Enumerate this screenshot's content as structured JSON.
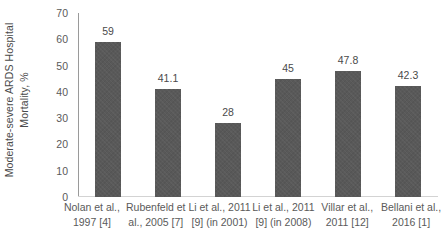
{
  "chart_data": {
    "type": "bar",
    "title": "",
    "xlabel": "",
    "ylabel": "Moderate-severe ARDS Hospital Mortality, %",
    "ylabel_lines": [
      "Moderate-severe ARDS Hospital",
      "Mortality, %"
    ],
    "ylim": [
      0,
      70
    ],
    "ytick_labels": [
      "70",
      "60",
      "50",
      "40",
      "30",
      "20",
      "10",
      "0"
    ],
    "ytick_values": [
      70,
      60,
      50,
      40,
      30,
      20,
      10,
      0
    ],
    "grid": false,
    "legend": false,
    "bar_color": "#595959",
    "categories": [
      "Nolan et al., 1997 [4]",
      "Rubenfeld et al., 2005 [7]",
      "Li et al., 2011 [9] (in 2001)",
      "Li et al., 2011 [9] (in 2008)",
      "Villar et al., 2011 [12]",
      "Bellani et al., 2016 [1]"
    ],
    "category_lines": [
      [
        "Nolan et al.,",
        "1997 [4]"
      ],
      [
        "Rubenfeld et",
        "al., 2005 [7]"
      ],
      [
        "Li et al., 2011",
        "[9] (in 2001)"
      ],
      [
        "Li et al., 2011",
        "[9] (in 2008)"
      ],
      [
        "Villar et al.,",
        "2011 [12]"
      ],
      [
        "Bellani et al.,",
        "2016 [1]"
      ]
    ],
    "values": [
      59,
      41.1,
      28,
      45,
      47.8,
      42.3
    ],
    "value_labels": [
      "59",
      "41.1",
      "28",
      "45",
      "47.8",
      "42.3"
    ]
  }
}
